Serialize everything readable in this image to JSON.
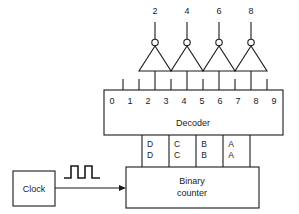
{
  "diagram": {
    "title_text_visible": false,
    "stroke_color": "#1a1a1a",
    "background_color": "#ffffff"
  },
  "inverter_outputs": [
    {
      "label": "2",
      "x": 155
    },
    {
      "label": "4",
      "x": 187
    },
    {
      "label": "6",
      "x": 219
    },
    {
      "label": "8",
      "x": 251
    }
  ],
  "decoder": {
    "label": "Decoder",
    "outputs": [
      {
        "label": "0",
        "x": 108
      },
      {
        "label": "1",
        "x": 124
      },
      {
        "label": "2",
        "x": 140
      },
      {
        "label": "3",
        "x": 156
      },
      {
        "label": "4",
        "x": 172
      },
      {
        "label": "5",
        "x": 188
      },
      {
        "label": "6",
        "x": 204
      },
      {
        "label": "7",
        "x": 220
      },
      {
        "label": "8",
        "x": 236
      },
      {
        "label": "9",
        "x": 252
      }
    ]
  },
  "bus_signals": [
    {
      "top": "D",
      "bottom": "D",
      "x": 148
    },
    {
      "top": "C",
      "bottom": "C",
      "x": 175
    },
    {
      "top": "B",
      "bottom": "B",
      "x": 202
    },
    {
      "top": "A",
      "bottom": "A",
      "x": 229
    }
  ],
  "counter": {
    "line1": "Binary",
    "line2": "counter"
  },
  "clock": {
    "label": "Clock",
    "waveform_pulses": 2
  }
}
